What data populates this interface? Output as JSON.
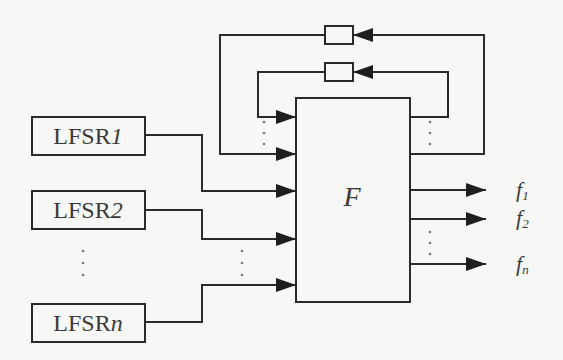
{
  "diagram": {
    "type": "block-diagram",
    "colors": {
      "stroke": "#2a2a2a",
      "background": "#f7f7f5",
      "text": "#3a3a3a"
    },
    "lfsrs": [
      {
        "label": "LFSR",
        "index": "1"
      },
      {
        "label": "LFSR",
        "index": "2"
      },
      {
        "label": "LFSR",
        "index": "n"
      }
    ],
    "function_block": {
      "label": "F"
    },
    "outputs": [
      {
        "label": "f",
        "sub": "1"
      },
      {
        "label": "f",
        "sub": "2"
      },
      {
        "label": "f",
        "sub": "n"
      }
    ],
    "feedback_delays": 2,
    "ellipsis": "⋮"
  }
}
